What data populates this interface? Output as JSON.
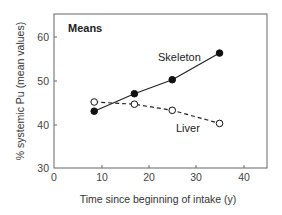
{
  "chart_data": {
    "type": "line",
    "title": "Means",
    "xlabel": "Time since beginning of intake (y)",
    "ylabel": "% systemic Pu (mean values)",
    "xlim": [
      0,
      45
    ],
    "ylim": [
      30,
      65
    ],
    "xticks": [
      0,
      10,
      20,
      30,
      40
    ],
    "yticks": [
      30,
      40,
      50,
      60
    ],
    "grid": false,
    "legend": "inline labels",
    "series": [
      {
        "name": "Skeleton",
        "style": "solid",
        "marker": "filled-circle",
        "x": [
          8.5,
          17,
          25,
          35
        ],
        "values": [
          43,
          47,
          50.2,
          56.3
        ]
      },
      {
        "name": "Liver",
        "style": "dashed",
        "marker": "open-circle",
        "x": [
          8.5,
          17,
          25,
          35
        ],
        "values": [
          45.1,
          44.6,
          43.2,
          40.2
        ]
      }
    ]
  },
  "labels": {
    "title": "Means",
    "xlabel": "Time since beginning of intake (y)",
    "ylabel": "% systemic Pu (mean values)",
    "skeleton": "Skeleton",
    "liver": "Liver",
    "xtick_0": "0",
    "xtick_1": "10",
    "xtick_2": "20",
    "xtick_3": "30",
    "xtick_4": "40",
    "ytick_0": "30",
    "ytick_1": "40",
    "ytick_2": "50",
    "ytick_3": "60"
  }
}
